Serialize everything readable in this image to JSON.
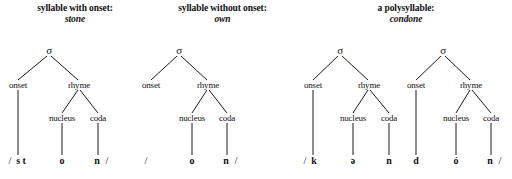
{
  "figure": {
    "width": 512,
    "height": 179,
    "ink_color": "#1a1a1a",
    "background": "#ffffff"
  },
  "panels": [
    {
      "id": "panel-stone",
      "caption_line1": "syllable with onset:",
      "caption_line2": "stone",
      "trees": [
        {
          "id": "tree-stone",
          "root_label": "σ",
          "nodes": [
            {
              "name": "onset",
              "label": "onset"
            },
            {
              "name": "rhyme",
              "label": "rhyme"
            },
            {
              "name": "nucleus",
              "label": "nucleus"
            },
            {
              "name": "coda",
              "label": "coda"
            }
          ],
          "segments": [
            {
              "name": "onset-segment",
              "label": "s t"
            },
            {
              "name": "nucleus-segment",
              "label": "o"
            },
            {
              "name": "coda-segment",
              "label": "n"
            }
          ],
          "open_slash": "/",
          "close_slash": "/",
          "transcription": "/s t o n/",
          "empty_onset": false
        }
      ]
    },
    {
      "id": "panel-own",
      "caption_line1": "syllable without onset:",
      "caption_line2": "own",
      "trees": [
        {
          "id": "tree-own",
          "root_label": "σ",
          "nodes": [
            {
              "name": "onset",
              "label": "onset"
            },
            {
              "name": "rhyme",
              "label": "rhyme"
            },
            {
              "name": "nucleus",
              "label": "nucleus"
            },
            {
              "name": "coda",
              "label": "coda"
            }
          ],
          "segments": [
            {
              "name": "nucleus-segment",
              "label": "o"
            },
            {
              "name": "coda-segment",
              "label": "n"
            }
          ],
          "open_slash": "/",
          "close_slash": "/",
          "transcription": "/ o n/",
          "empty_onset": true
        }
      ]
    },
    {
      "id": "panel-condone",
      "caption_line1": "a polysyllable:",
      "caption_line2": "condone",
      "trees": [
        {
          "id": "tree-condone-1",
          "root_label": "σ",
          "nodes": [
            {
              "name": "onset",
              "label": "onset"
            },
            {
              "name": "rhyme",
              "label": "rhyme"
            },
            {
              "name": "nucleus",
              "label": "nucleus"
            },
            {
              "name": "coda",
              "label": "coda"
            }
          ],
          "segments": [
            {
              "name": "onset-segment",
              "label": "k"
            },
            {
              "name": "nucleus-segment",
              "label": "ə"
            },
            {
              "name": "coda-segment",
              "label": "n"
            }
          ],
          "open_slash": "/",
          "close_slash": "",
          "empty_onset": false
        },
        {
          "id": "tree-condone-2",
          "root_label": "σ",
          "nodes": [
            {
              "name": "onset",
              "label": "onset"
            },
            {
              "name": "rhyme",
              "label": "rhyme"
            },
            {
              "name": "nucleus",
              "label": "nucleus"
            },
            {
              "name": "coda",
              "label": "coda"
            }
          ],
          "segments": [
            {
              "name": "onset-segment",
              "label": "d"
            },
            {
              "name": "nucleus-segment",
              "label": "ó"
            },
            {
              "name": "coda-segment",
              "label": "n"
            }
          ],
          "open_slash": "",
          "close_slash": "/",
          "empty_onset": false
        }
      ],
      "transcription": "/k ə n d ó n/"
    }
  ]
}
